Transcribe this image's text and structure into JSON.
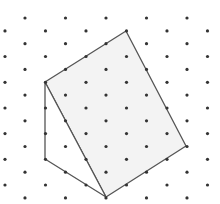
{
  "diagram": {
    "type": "isometric-dot-grid",
    "grid": {
      "dot_color": "#333333",
      "dot_radius": 1.6,
      "row_start_y": 18,
      "row_step": 12.85,
      "rows": 15,
      "col_step": 40.5,
      "even_row_x_start": 25,
      "odd_row_x_start": 5,
      "cols_even": 5,
      "cols_odd": 6
    },
    "shapes": [
      {
        "name": "quadrilateral-face",
        "points": [
          [
            45,
            82
          ],
          [
            126,
            31
          ],
          [
            186,
            146
          ],
          [
            106,
            197
          ]
        ],
        "fill": "#f3f3f3",
        "stroke": "#555555"
      },
      {
        "name": "triangle-face",
        "points": [
          [
            45,
            82
          ],
          [
            106,
            197
          ],
          [
            45,
            159
          ]
        ],
        "fill": "#ffffff",
        "stroke": "#555555"
      }
    ],
    "line_color": "#555555",
    "line_width": 1.3
  }
}
